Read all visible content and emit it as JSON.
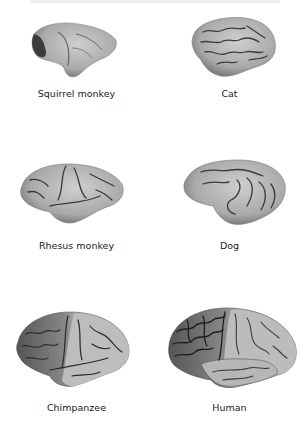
{
  "figure": {
    "panels": [
      {
        "id": "squirrel-monkey",
        "label": "Squirrel monkey"
      },
      {
        "id": "cat",
        "label": "Cat"
      },
      {
        "id": "rhesus-monkey",
        "label": "Rhesus monkey"
      },
      {
        "id": "dog",
        "label": "Dog"
      },
      {
        "id": "chimpanzee",
        "label": "Chimpanzee"
      },
      {
        "id": "human",
        "label": "Human"
      }
    ],
    "colors": {
      "brain_fill": "#b4b4b4",
      "brain_shade": "#7a7a7a",
      "sulci": "#3a3a3a",
      "label_text": "#222222"
    }
  }
}
